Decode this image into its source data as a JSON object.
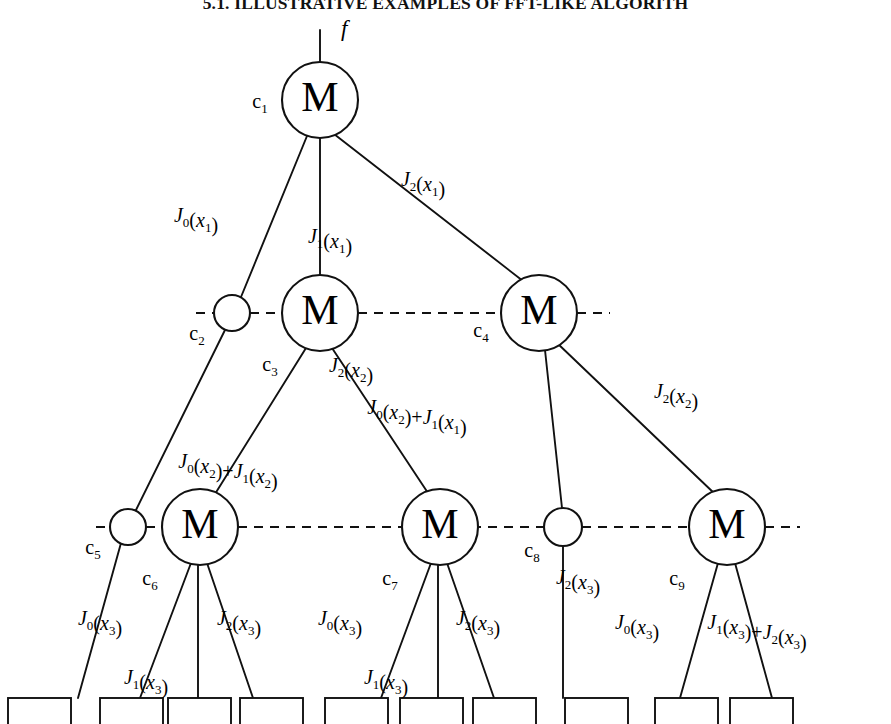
{
  "page": {
    "running_head": "5.1. ILLUSTRATIVE EXAMPLES OF FFT-LIKE ALGORITH"
  },
  "figure": {
    "root_input_label": "f",
    "node_letter": "M",
    "nodes": [
      {
        "id": "c1",
        "tag": "c",
        "sub": "1",
        "type": "M",
        "cx": 320,
        "cy": 100,
        "r": 38
      },
      {
        "id": "c2",
        "tag": "c",
        "sub": "2",
        "type": "circle",
        "cx": 232,
        "cy": 313,
        "r": 18
      },
      {
        "id": "c3",
        "tag": "c",
        "sub": "3",
        "type": "M",
        "cx": 320,
        "cy": 313,
        "r": 38
      },
      {
        "id": "c4",
        "tag": "c",
        "sub": "4",
        "type": "M",
        "cx": 539,
        "cy": 313,
        "r": 38
      },
      {
        "id": "c5",
        "tag": "c",
        "sub": "5",
        "type": "circle",
        "cx": 128,
        "cy": 527,
        "r": 18
      },
      {
        "id": "c6",
        "tag": "c",
        "sub": "6",
        "type": "M",
        "cx": 200,
        "cy": 527,
        "r": 38
      },
      {
        "id": "c7",
        "tag": "c",
        "sub": "7",
        "type": "M",
        "cx": 440,
        "cy": 527,
        "r": 38
      },
      {
        "id": "c8",
        "tag": "c",
        "sub": "8",
        "type": "circle",
        "cx": 563,
        "cy": 527,
        "r": 19
      },
      {
        "id": "c9",
        "tag": "c",
        "sub": "9",
        "type": "M",
        "cx": 727,
        "cy": 527,
        "r": 38
      }
    ],
    "edge_labels": [
      {
        "id": "e-J0x1",
        "text": "J0(x1)",
        "x": 196,
        "y": 222
      },
      {
        "id": "e-J1x1",
        "text": "J1(x1)",
        "x": 330,
        "y": 243
      },
      {
        "id": "e-J2x1",
        "text": "J2(x1)",
        "x": 423,
        "y": 186
      },
      {
        "id": "e-J2x2-left",
        "text": "J2(x2)",
        "x": 351,
        "y": 372
      },
      {
        "id": "e-J0x2J1x1",
        "text": "J0(x2)+J1(x1)",
        "x": 417,
        "y": 414
      },
      {
        "id": "e-J2x2-right",
        "text": "J2(x2)",
        "x": 676,
        "y": 398
      },
      {
        "id": "e-J0x2J1x2",
        "text": "J0(x2)+J1(x2)",
        "x": 228,
        "y": 468
      },
      {
        "id": "e-J2x3-c8",
        "text": "J2(x3)",
        "x": 578,
        "y": 584
      },
      {
        "id": "e-J0x3-c6",
        "text": "J0(x3)",
        "x": 100,
        "y": 625
      },
      {
        "id": "e-J2x3-c6",
        "text": "J2(x3)",
        "x": 239,
        "y": 625
      },
      {
        "id": "e-J1x3-c6",
        "text": "J1(x3)",
        "x": 146,
        "y": 684
      },
      {
        "id": "e-J0x3-c7",
        "text": "J0(x3)",
        "x": 340,
        "y": 625
      },
      {
        "id": "e-J2x3-c7",
        "text": "J2(x3)",
        "x": 478,
        "y": 625
      },
      {
        "id": "e-J1x3-c7",
        "text": "J1(x3)",
        "x": 386,
        "y": 684
      },
      {
        "id": "e-J0x3-c9",
        "text": "J0(x3)",
        "x": 637,
        "y": 629
      },
      {
        "id": "e-J1x3J2x3",
        "text": "J1(x3)+J2(x3)",
        "x": 757,
        "y": 629
      }
    ],
    "edges": [
      {
        "id": "edge-root-input",
        "x1": 320,
        "y1": 30,
        "x2": 320,
        "y2": 62
      },
      {
        "id": "edge-c1-c2",
        "x1": 307,
        "y1": 136,
        "x2": 241,
        "y2": 297
      },
      {
        "id": "edge-c1-c3",
        "x1": 320,
        "y1": 138,
        "x2": 320,
        "y2": 275
      },
      {
        "id": "edge-c1-c4",
        "x1": 334,
        "y1": 134,
        "x2": 523,
        "y2": 281
      },
      {
        "id": "edge-c2-c5",
        "x1": 225,
        "y1": 330,
        "x2": 135,
        "y2": 512
      },
      {
        "id": "edge-c3-c6",
        "x1": 306,
        "y1": 348,
        "x2": 215,
        "y2": 494
      },
      {
        "id": "edge-c3-c7",
        "x1": 332,
        "y1": 348,
        "x2": 428,
        "y2": 493
      },
      {
        "id": "edge-c4-c8",
        "x1": 545,
        "y1": 350,
        "x2": 562,
        "y2": 508
      },
      {
        "id": "edge-c4-c9",
        "x1": 556,
        "y1": 342,
        "x2": 716,
        "y2": 495
      },
      {
        "id": "edge-c5-b1",
        "x1": 121,
        "y1": 543,
        "x2": 78,
        "y2": 698
      },
      {
        "id": "edge-c6-b2",
        "x1": 191,
        "y1": 563,
        "x2": 140,
        "y2": 698
      },
      {
        "id": "edge-c6-b3",
        "x1": 198,
        "y1": 565,
        "x2": 198,
        "y2": 698
      },
      {
        "id": "edge-c6-b4",
        "x1": 207,
        "y1": 563,
        "x2": 253,
        "y2": 698
      },
      {
        "id": "edge-c7-b5",
        "x1": 431,
        "y1": 563,
        "x2": 381,
        "y2": 698
      },
      {
        "id": "edge-c7-b6",
        "x1": 438,
        "y1": 565,
        "x2": 438,
        "y2": 698
      },
      {
        "id": "edge-c7-b7",
        "x1": 447,
        "y1": 563,
        "x2": 494,
        "y2": 698
      },
      {
        "id": "edge-c8-b8",
        "x1": 563,
        "y1": 546,
        "x2": 563,
        "y2": 698
      },
      {
        "id": "edge-c9-b9",
        "x1": 718,
        "y1": 563,
        "x2": 680,
        "y2": 698
      },
      {
        "id": "edge-c9-b10",
        "x1": 735,
        "y1": 563,
        "x2": 772,
        "y2": 698
      }
    ],
    "dashed_rows": [
      {
        "id": "dash-row-2",
        "y": 313,
        "segments": [
          [
            196,
            214
          ],
          [
            250,
            282
          ],
          [
            358,
            501
          ],
          [
            577,
            610
          ]
        ]
      },
      {
        "id": "dash-row-3",
        "y": 527,
        "segments": [
          [
            96,
            110
          ],
          [
            146,
            162
          ],
          [
            238,
            424
          ],
          [
            456,
            544
          ],
          [
            582,
            689
          ],
          [
            765,
            800
          ]
        ]
      }
    ],
    "leaf_boxes": [
      {
        "id": "leaf-1",
        "x": 8,
        "y": 698,
        "w": 63,
        "h": 34
      },
      {
        "id": "leaf-2",
        "x": 100,
        "y": 698,
        "w": 63,
        "h": 34
      },
      {
        "id": "leaf-3",
        "x": 168,
        "y": 698,
        "w": 63,
        "h": 34
      },
      {
        "id": "leaf-4",
        "x": 240,
        "y": 698,
        "w": 63,
        "h": 34
      },
      {
        "id": "leaf-5",
        "x": 325,
        "y": 698,
        "w": 63,
        "h": 34
      },
      {
        "id": "leaf-6",
        "x": 400,
        "y": 698,
        "w": 63,
        "h": 34
      },
      {
        "id": "leaf-7",
        "x": 473,
        "y": 698,
        "w": 63,
        "h": 34
      },
      {
        "id": "leaf-8",
        "x": 565,
        "y": 698,
        "w": 63,
        "h": 34
      },
      {
        "id": "leaf-9",
        "x": 655,
        "y": 698,
        "w": 63,
        "h": 34
      },
      {
        "id": "leaf-10",
        "x": 730,
        "y": 698,
        "w": 63,
        "h": 34
      }
    ],
    "colors": {
      "stroke": "#111111",
      "text": "#0a0a0a",
      "background": "#ffffff"
    }
  }
}
